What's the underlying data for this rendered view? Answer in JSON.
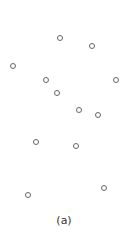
{
  "figure": {
    "caption": "(a)",
    "caption_pos": {
      "x": 64,
      "y": 220
    },
    "point_style": {
      "stroke": "#666666",
      "fill": "#ffffff",
      "diameter": 6
    }
  },
  "points": [
    {
      "x": 60,
      "y": 38
    },
    {
      "x": 92,
      "y": 46
    },
    {
      "x": 13,
      "y": 66
    },
    {
      "x": 46,
      "y": 80
    },
    {
      "x": 116,
      "y": 80
    },
    {
      "x": 57,
      "y": 93
    },
    {
      "x": 79,
      "y": 110
    },
    {
      "x": 98,
      "y": 115
    },
    {
      "x": 36,
      "y": 142
    },
    {
      "x": 76,
      "y": 146
    },
    {
      "x": 104,
      "y": 188
    },
    {
      "x": 28,
      "y": 195
    }
  ]
}
